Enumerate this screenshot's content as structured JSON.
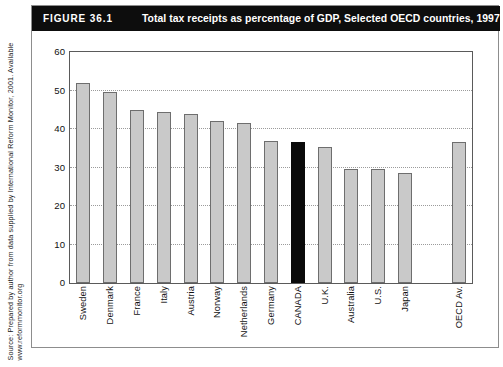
{
  "figure": {
    "number": "FIGURE 36.1",
    "title": "Total tax receipts as percentage of GDP, Selected OECD countries, 1997",
    "source": "Source: Prepared by author from data supplied by International Reform Monitor, 2001. Available www.reformmonitor.org"
  },
  "colors": {
    "title_bar_background": "#0d0d0d",
    "title_text": "#ffffff",
    "bar_fill": "#c9c9c9",
    "bar_outline": "#6e6e6e",
    "highlight_bar_fill": "#0a0a0a",
    "gridline": "#9b9b9b",
    "plot_border": "#5a5a5a",
    "figure_border": "#8d8d8d"
  },
  "chart_data": {
    "type": "bar",
    "title": "Total tax receipts as percentage of GDP, Selected OECD countries, 1997",
    "xlabel": "",
    "ylabel": "",
    "ylim": [
      0,
      60
    ],
    "yticks": [
      0,
      10,
      20,
      30,
      40,
      50,
      60
    ],
    "ytick_labels": [
      "0",
      "10",
      "20",
      "30",
      "40",
      "50",
      "60"
    ],
    "grid": true,
    "legend": false,
    "highlight_category": "CANADA",
    "gap_before": "OECD Av.",
    "categories": [
      "Sweden",
      "Denmark",
      "France",
      "Italy",
      "Austria",
      "Norway",
      "Netherlands",
      "Germany",
      "CANADA",
      "U.K.",
      "Australia",
      "U.S.",
      "Japan",
      "OECD Av."
    ],
    "values": [
      52,
      49.5,
      45,
      44.5,
      44,
      42,
      41.5,
      37,
      36.5,
      35.2,
      29.5,
      29.5,
      28.5,
      36.5
    ]
  }
}
